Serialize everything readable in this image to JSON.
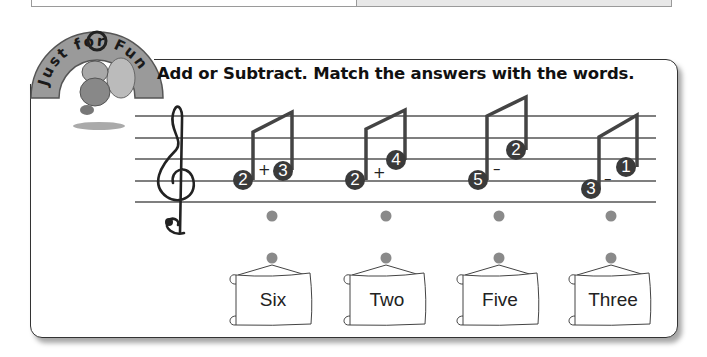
{
  "header": {
    "badge_text": "Just for Fun",
    "instruction": "Add or Subtract.  Match the answers with the words."
  },
  "colors": {
    "note_fill": "#3a3a3a",
    "dot": "#8a8a8a",
    "staff": "#444444",
    "badge_arc": "#9a9a9a"
  },
  "problems": [
    {
      "a": "2",
      "op": "+",
      "b": "3"
    },
    {
      "a": "2",
      "op": "+",
      "b": "4"
    },
    {
      "a": "5",
      "op": "–",
      "b": "2"
    },
    {
      "a": "3",
      "op": "–",
      "b": "1"
    }
  ],
  "words": [
    {
      "label": "Six"
    },
    {
      "label": "Two"
    },
    {
      "label": "Five"
    },
    {
      "label": "Three"
    }
  ]
}
